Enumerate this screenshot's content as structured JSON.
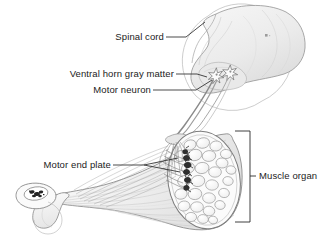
{
  "figure": {
    "background_color": "#ffffff",
    "line_color": "#3a3a3a",
    "text_color": "#1b1b1b",
    "fill_light": "#f0f0f0",
    "fill_mid": "#e2e2e2",
    "fill_dark": "#8c8c8c"
  },
  "labels": {
    "spinal_cord": "Spinal cord",
    "ventral_horn": "Ventral horn gray matter",
    "motor_neuron": "Motor neuron",
    "motor_end_plate": "Motor end plate",
    "muscle_organ": "Muscle organ"
  },
  "structures": {
    "spinal_cord_name": "spinal-cord-segment",
    "gray_matter_name": "ventral-horn-gray-matter",
    "neuron_soma_count": 2,
    "nerve_name": "motor-axon-bundle",
    "muscle_name": "muscle-organ",
    "muscle_fiber_count": 28,
    "end_plate_count": 6,
    "bone_name": "bone-cross-section",
    "tendon_name": "tendon"
  }
}
